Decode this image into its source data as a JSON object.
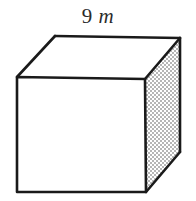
{
  "figure": {
    "kind": "cube-diagram",
    "background_color": "#ffffff",
    "edge_color": "#1a1a1a",
    "edge_width": 2.6,
    "front_face_color": "#ffffff",
    "top_face_color": "#ffffff",
    "right_face_color": "#d9d9d9",
    "right_face_pattern": "stipple-checker",
    "label": {
      "number": "9",
      "separator": " ",
      "unit": "m"
    },
    "vertices": {
      "front_top_left": [
        17,
        77
      ],
      "front_top_right": [
        145,
        79
      ],
      "front_bottom_right": [
        146,
        192
      ],
      "front_bottom_left": [
        17,
        192
      ],
      "back_top_left": [
        55,
        36
      ],
      "back_top_right": [
        180,
        38
      ],
      "back_bottom_right": [
        180,
        152
      ]
    }
  }
}
